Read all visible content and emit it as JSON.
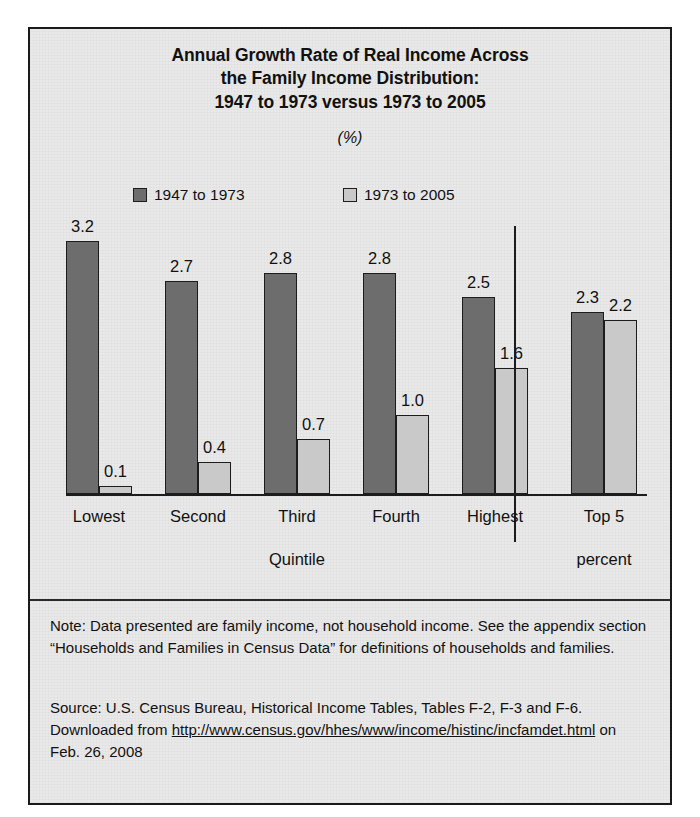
{
  "title": {
    "line1": "Annual Growth Rate of Real Income Across",
    "line2": "the Family Income Distribution:",
    "line3": "1947 to 1973 versus 1973 to 2005",
    "units": "(%)"
  },
  "legend": {
    "series1": "1947 to 1973",
    "series2": "1973 to 2005"
  },
  "axis": {
    "quintile_label": "Quintile",
    "top5_line1": "Top 5",
    "top5_line2": "percent"
  },
  "footer": {
    "note": "Note: Data presented are family income, not household income. See the appendix section “Households and Families in Census Data” for definitions of households and families.",
    "source_pre": "Source: U.S. Census Bureau, Historical Income Tables, Tables F-2, F-3 and F-6. Downloaded from ",
    "source_url": "http://www.census.gov/hhes/www/income/histinc/incfamdet.html",
    "source_post": " on Feb. 26, 2008"
  },
  "colors": {
    "series1": "#6d6d6d",
    "series2": "#c9c9c9",
    "outline": "#1c1c1c",
    "background": "#e9e9e9"
  },
  "chart_data": {
    "type": "bar",
    "title": "Annual Growth Rate of Real Income Across the Family Income Distribution: 1947 to 1973 versus 1973 to 2005",
    "xlabel": "Quintile",
    "ylabel": "(%)",
    "ylim": [
      0,
      3.6
    ],
    "grid": false,
    "legend_position": "top",
    "categories": [
      "Lowest",
      "Second",
      "Third",
      "Fourth",
      "Highest",
      "Top 5 percent"
    ],
    "series": [
      {
        "name": "1947 to 1973",
        "values": [
          3.2,
          2.7,
          2.8,
          2.8,
          2.5,
          2.3
        ]
      },
      {
        "name": "1973 to 2005",
        "values": [
          0.1,
          0.4,
          0.7,
          1.0,
          1.6,
          2.2
        ]
      }
    ],
    "labels": {
      "series1": [
        "3.2",
        "2.7",
        "2.8",
        "2.8",
        "2.5",
        "2.3"
      ],
      "series2": [
        "0.1",
        "0.4",
        "0.7",
        "1.0",
        "1.6",
        "2.2"
      ]
    }
  }
}
